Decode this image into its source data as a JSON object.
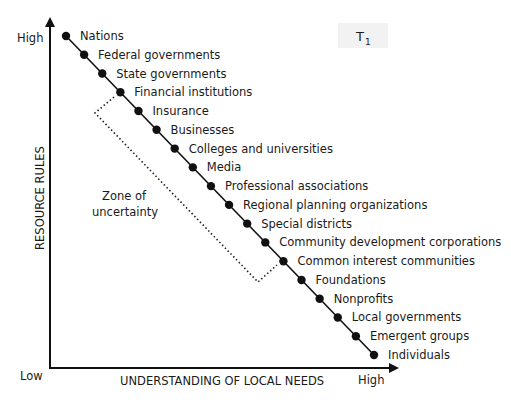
{
  "diagram": {
    "badge": {
      "main": "T",
      "subscript": "1"
    },
    "y_axis": {
      "label": "RESOURCE RULES",
      "high": "High",
      "low": "Low"
    },
    "x_axis": {
      "label": "UNDERSTANDING OF LOCAL NEEDS",
      "high": "High"
    },
    "zone_label": [
      "Zone of",
      "uncertainty"
    ],
    "zone_span": {
      "from_item": "Financial institutions",
      "to_item": "Common interest communities"
    },
    "items": [
      "Nations",
      "Federal governments",
      "State governments",
      "Financial institutions",
      "Insurance",
      "Businesses",
      "Colleges and universities",
      "Media",
      "Professional associations",
      "Regional planning organizations",
      "Special districts",
      "Community development corporations",
      "Common interest communities",
      "Foundations",
      "Nonprofits",
      "Local governments",
      "Emergent groups",
      "Individuals"
    ]
  }
}
